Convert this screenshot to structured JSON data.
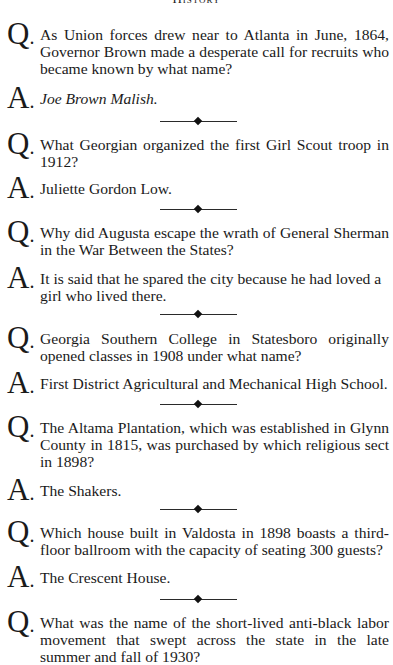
{
  "header": {
    "section_title": "History"
  },
  "labels": {
    "question": "Q",
    "answer": "A",
    "dot": "."
  },
  "items": [
    {
      "question": "As Union forces drew near to Atlanta in June, 1864, Governor Brown made a desperate call for recruits who became known by what name?",
      "answer": "Joe Brown Malish.",
      "answer_italic": true
    },
    {
      "question": "What Georgian organized the first Girl Scout troop in 1912?",
      "answer": "Juliette Gordon Low."
    },
    {
      "question": "Why did Augusta escape the wrath of General Sherman in the War Between the States?",
      "answer": "It is said that he spared the city because he had loved a girl who lived there."
    },
    {
      "question": "Georgia Southern College in Statesboro originally opened classes in 1908 under what name?",
      "answer": "First District Agricultural and Mechanical High School."
    },
    {
      "question": "The Altama Plantation, which was established in Glynn County in 1815, was purchased by which religious sect in 1898?",
      "answer": "The Shakers."
    },
    {
      "question": "Which house built in Valdosta in 1898 boasts a third-floor ballroom with the capacity of seating 300 guests?",
      "answer": "The Crescent House."
    },
    {
      "question": "What was the name of the short-lived anti-black labor movement that swept across the state in the late summer and fall of 1930?"
    }
  ],
  "divider_icon": "diamond-rule"
}
